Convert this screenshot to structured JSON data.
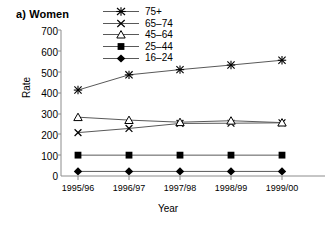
{
  "chart_data": {
    "type": "line",
    "title": "a) Women",
    "xlabel": "Year",
    "ylabel": "Rate",
    "categories": [
      "1995/96",
      "1996/97",
      "1997/98",
      "1998/99",
      "1999/00"
    ],
    "ylim": [
      0,
      700
    ],
    "yticks": [
      0,
      100,
      200,
      300,
      400,
      500,
      600,
      700
    ],
    "grid": false,
    "legend_position": "top-center",
    "series": [
      {
        "name": "75+",
        "marker": "asterisk",
        "values": [
          412,
          485,
          510,
          532,
          555
        ]
      },
      {
        "name": "65–74",
        "marker": "x",
        "values": [
          208,
          228,
          252,
          253,
          255
        ]
      },
      {
        "name": "45–64",
        "marker": "triangle-open",
        "values": [
          282,
          268,
          258,
          265,
          256
        ]
      },
      {
        "name": "25–44",
        "marker": "square-filled",
        "values": [
          100,
          100,
          100,
          100,
          100
        ]
      },
      {
        "name": "16–24",
        "marker": "diamond-filled",
        "values": [
          22,
          22,
          22,
          22,
          22
        ]
      }
    ]
  },
  "axis": {
    "yticks": [
      "700",
      "600",
      "500",
      "400",
      "300",
      "200",
      "100",
      "0"
    ],
    "xticks": [
      "1995/96",
      "1996/97",
      "1997/98",
      "1998/99",
      "1999/00"
    ],
    "ylabel": "Rate",
    "xlabel": "Year"
  },
  "title": "a) Women",
  "legend": {
    "items": [
      {
        "label": "75+",
        "marker": "asterisk-marker"
      },
      {
        "label": "65–74",
        "marker": "x-marker"
      },
      {
        "label": "45–64",
        "marker": "triangle-open-marker"
      },
      {
        "label": "25–44",
        "marker": "square-filled-marker"
      },
      {
        "label": "16–24",
        "marker": "diamond-filled-marker"
      }
    ]
  },
  "colors": {
    "line": "#595959",
    "axis": "#808080",
    "marker": "#000000",
    "text": "#000000",
    "background": "#ffffff"
  }
}
